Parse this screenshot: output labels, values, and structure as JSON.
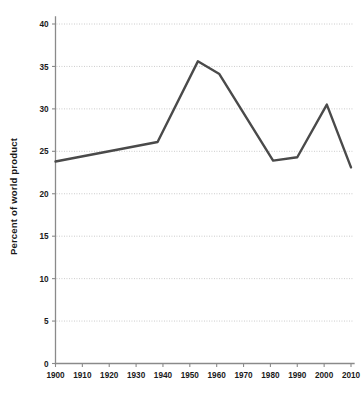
{
  "chart_data": {
    "type": "line",
    "title": "",
    "xlabel": "",
    "ylabel": "Percent of world product",
    "xlim": [
      1900,
      2010
    ],
    "ylim": [
      0,
      40
    ],
    "grid": true,
    "legend": "none",
    "xticks": [
      1900,
      1910,
      1920,
      1930,
      1940,
      1950,
      1960,
      1970,
      1980,
      1990,
      2000,
      2010
    ],
    "xtick_labels": [
      "1900",
      "1910",
      "1920",
      "1930",
      "1940",
      "1950",
      "1960",
      "1970",
      "1980",
      "1990",
      "2000",
      "2010"
    ],
    "yticks": [
      0,
      5,
      10,
      15,
      20,
      25,
      30,
      35,
      40
    ],
    "ytick_labels": [
      "0",
      "5",
      "10",
      "15",
      "20",
      "25",
      "30",
      "35",
      "40"
    ],
    "series": [
      {
        "name": "Percent of world product",
        "color": "#4a4a4a",
        "x": [
          1900,
          1938,
          1953,
          1961,
          1981,
          1990,
          2001,
          2010
        ],
        "values": [
          23.8,
          26.1,
          35.6,
          34.1,
          23.9,
          24.3,
          30.5,
          23.1
        ]
      }
    ]
  },
  "axes": {
    "y_axis_title": "Percent of world product"
  }
}
